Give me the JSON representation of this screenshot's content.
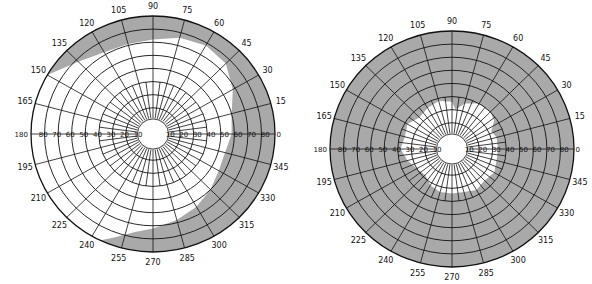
{
  "figure": {
    "colors": {
      "shade": "#a9a9a9",
      "line": "#111111",
      "background": "#ffffff",
      "field": "#ffffff"
    },
    "angle_labels": [
      "0",
      "15",
      "30",
      "45",
      "60",
      "75",
      "90",
      "105",
      "120",
      "135",
      "150",
      "165",
      "180",
      "195",
      "210",
      "225",
      "240",
      "255",
      "270",
      "285",
      "300",
      "315",
      "330",
      "345"
    ],
    "scale_labels_right": [
      "10",
      "20",
      "30",
      "40",
      "50",
      "60",
      "70",
      "80",
      "0"
    ],
    "scale_labels_left": [
      "180",
      "80",
      "70",
      "60",
      "50",
      "40",
      "30",
      "20",
      "10"
    ],
    "ring_count": 9
  },
  "charts": [
    {
      "name": "left-field-chart",
      "cx": 153,
      "cy": 134,
      "rx": 122,
      "ry": 118,
      "seen_field_boundary": [
        [
          0,
          58
        ],
        [
          15,
          60
        ],
        [
          20,
          62
        ],
        [
          30,
          68
        ],
        [
          45,
          76
        ],
        [
          60,
          78
        ],
        [
          75,
          76
        ],
        [
          90,
          72
        ],
        [
          105,
          71
        ],
        [
          120,
          72
        ],
        [
          135,
          78
        ],
        [
          150,
          90
        ],
        [
          160,
          94
        ],
        [
          170,
          100
        ],
        [
          180,
          100
        ],
        [
          195,
          100
        ],
        [
          210,
          100
        ],
        [
          225,
          100
        ],
        [
          235,
          100
        ],
        [
          240,
          96
        ],
        [
          250,
          84
        ],
        [
          260,
          76
        ],
        [
          270,
          72
        ],
        [
          285,
          68
        ],
        [
          300,
          64
        ],
        [
          315,
          60
        ],
        [
          330,
          56
        ],
        [
          345,
          55
        ],
        [
          360,
          58
        ]
      ]
    },
    {
      "name": "right-field-chart",
      "cx": 452,
      "cy": 149,
      "rx": 122,
      "ry": 118,
      "seen_field_boundary": [
        [
          0,
          34
        ],
        [
          15,
          34
        ],
        [
          25,
          32
        ],
        [
          35,
          38
        ],
        [
          45,
          40
        ],
        [
          60,
          40
        ],
        [
          75,
          36
        ],
        [
          85,
          30
        ],
        [
          90,
          36
        ],
        [
          105,
          38
        ],
        [
          120,
          36
        ],
        [
          135,
          34
        ],
        [
          150,
          38
        ],
        [
          165,
          36
        ],
        [
          180,
          38
        ],
        [
          195,
          34
        ],
        [
          210,
          30
        ],
        [
          225,
          28
        ],
        [
          240,
          32
        ],
        [
          255,
          34
        ],
        [
          270,
          34
        ],
        [
          285,
          34
        ],
        [
          300,
          36
        ],
        [
          315,
          34
        ],
        [
          330,
          36
        ],
        [
          345,
          34
        ],
        [
          360,
          34
        ]
      ]
    }
  ]
}
